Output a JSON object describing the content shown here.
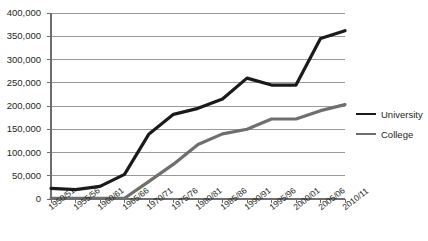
{
  "chart_data": {
    "type": "line",
    "title": "",
    "xlabel": "",
    "ylabel": "",
    "ylim": [
      0,
      400000
    ],
    "grid": true,
    "legend_position": "right",
    "categories": [
      "1950/51",
      "1955/56",
      "1960/61",
      "1965/66",
      "1970/71",
      "1975/76",
      "1980/81",
      "1985/86",
      "1990/91",
      "1995/96",
      "2000/01",
      "2005/06",
      "2010/11"
    ],
    "ytick_labels": [
      "400,000",
      "350,000",
      "300,000",
      "250,000",
      "200,000",
      "150,000",
      "100,000",
      "50,000",
      "0"
    ],
    "ytick_values": [
      400000,
      350000,
      300000,
      250000,
      200000,
      150000,
      100000,
      50000,
      0
    ],
    "series": [
      {
        "name": "University",
        "color": "#1a1a1a",
        "width": 3.2,
        "values": [
          23000,
          20000,
          27000,
          53000,
          140000,
          182000,
          195000,
          215000,
          260000,
          245000,
          245000,
          345000,
          362000
        ]
      },
      {
        "name": "College",
        "color": "#6f6f6f",
        "width": 3.2,
        "values": [
          1500,
          1500,
          1500,
          1500,
          38000,
          75000,
          117000,
          140000,
          150000,
          172000,
          172000,
          190000,
          203000
        ]
      }
    ]
  },
  "legend": {
    "items": [
      {
        "label": "University"
      },
      {
        "label": "College"
      }
    ]
  },
  "colors": {
    "university": "#1a1a1a",
    "college": "#6f6f6f",
    "gridline": "#9a9a9a",
    "axis": "#6d6d6d",
    "text": "#231f20"
  }
}
